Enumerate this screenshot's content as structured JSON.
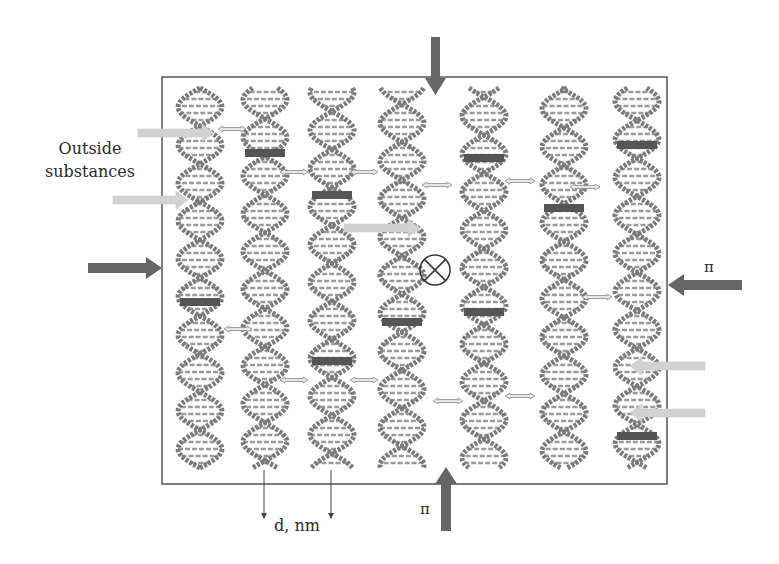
{
  "figure": {
    "type": "schematic",
    "colors": {
      "frame": "#555555",
      "helix_strand": "#7a7a7a",
      "helix_rung": "#9a9a9a",
      "ligand_bar": "#555555",
      "pressure_arrow": "#666666",
      "outside_arrow": "#cfcfcf",
      "spacing_arrow": "#8a8a8a"
    }
  },
  "labels": {
    "outside_substances_line1": "Outside",
    "outside_substances_line2": "substances",
    "pi_right": "π",
    "pi_bottom": "π",
    "distance": "d, nm"
  },
  "symbols": {
    "perpendicular_into_page": "⊗"
  },
  "helices": [
    {
      "id": 1,
      "cx": 200,
      "bars": [
        302
      ]
    },
    {
      "id": 2,
      "cx": 265,
      "bars": [
        153
      ]
    },
    {
      "id": 3,
      "cx": 332,
      "bars": [
        195,
        361
      ]
    },
    {
      "id": 4,
      "cx": 402,
      "bars": [
        322
      ]
    },
    {
      "id": 5,
      "cx": 484,
      "bars": [
        158,
        312
      ]
    },
    {
      "id": 6,
      "cx": 564,
      "bars": [
        208
      ]
    },
    {
      "id": 7,
      "cx": 637,
      "bars": [
        145,
        436
      ]
    }
  ],
  "pressure_arrows": [
    {
      "side": "top",
      "label": ""
    },
    {
      "side": "left",
      "label": ""
    },
    {
      "side": "right",
      "label": "π"
    },
    {
      "side": "bottom",
      "label": "π"
    }
  ]
}
